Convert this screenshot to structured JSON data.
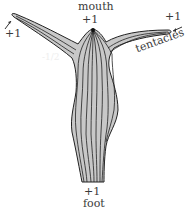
{
  "diagram": {
    "labels": {
      "mouth": "mouth",
      "mouth_value": "+1",
      "foot": "foot",
      "foot_value": "+1",
      "left_tentacle_value": "+1",
      "right_tentacle_value": "+1",
      "tentacles": "tentacles",
      "faint_center": "-1/2"
    },
    "colors": {
      "body_fill": "#c8c8c8",
      "stroke": "#1a1a1a",
      "text": "#3a3a3a"
    }
  }
}
